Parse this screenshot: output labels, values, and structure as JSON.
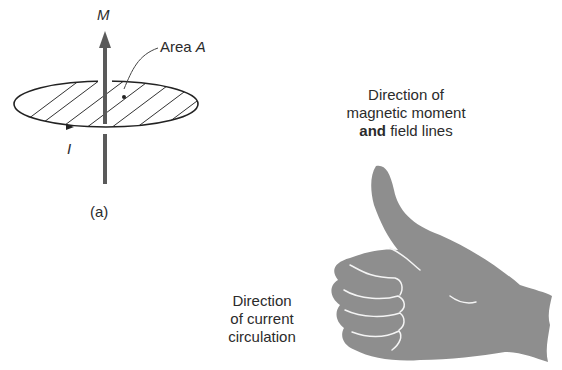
{
  "figure_a": {
    "moment_label": "M",
    "area_label_prefix": "Area ",
    "area_label_var": "A",
    "current_label": "I",
    "caption": "(a)"
  },
  "figure_b": {
    "thumb_caption_line1": "Direction of",
    "thumb_caption_line2": "magnetic moment",
    "thumb_caption_line3_bold": "and",
    "thumb_caption_line3_rest": " field lines",
    "fingers_caption_line1": "Direction",
    "fingers_caption_line2": "of current",
    "fingers_caption_line3": "circulation"
  },
  "colors": {
    "ink": "#2a2a2a",
    "hand_fill": "#8e8e8e",
    "arrow": "#5a5a5a"
  }
}
